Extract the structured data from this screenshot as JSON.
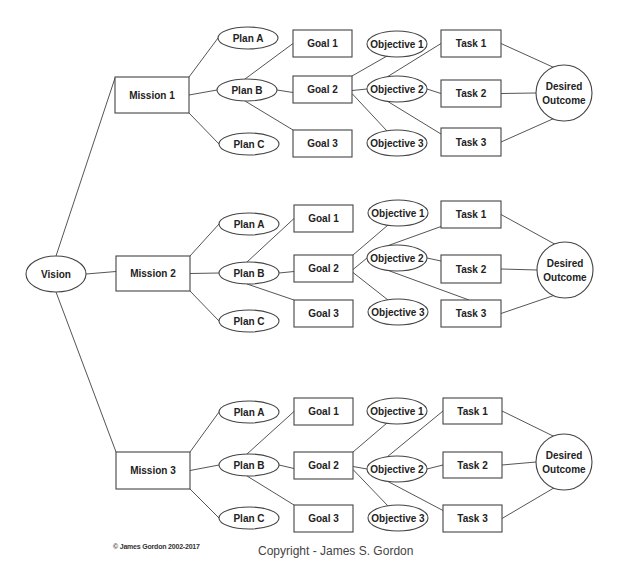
{
  "diagram": {
    "root": {
      "id": "vision",
      "label": "Vision",
      "shape": "ellipse",
      "cx": 56,
      "cy": 274,
      "rx": 30,
      "ry": 18
    },
    "missions": [
      {
        "id": "mission1",
        "label": "Mission 1",
        "box": {
          "x": 115,
          "y": 77,
          "w": 74,
          "h": 36
        },
        "plans": [
          {
            "label": "Plan A",
            "cx": 248,
            "cy": 38
          },
          {
            "label": "Plan B",
            "cx": 247,
            "cy": 90
          },
          {
            "label": "Plan C",
            "cx": 249,
            "cy": 144
          }
        ],
        "goals": [
          {
            "label": "Goal 1",
            "x": 293,
            "y": 30,
            "w": 59,
            "h": 27
          },
          {
            "label": "Goal 2",
            "x": 293,
            "y": 76,
            "w": 59,
            "h": 27
          },
          {
            "label": "Goal 3",
            "x": 293,
            "y": 130,
            "w": 59,
            "h": 27
          }
        ],
        "objectives": [
          {
            "label": "Objective 1",
            "cx": 397,
            "cy": 44
          },
          {
            "label": "Objective 2",
            "cx": 397,
            "cy": 89
          },
          {
            "label": "Objective 3",
            "cx": 397,
            "cy": 143
          }
        ],
        "tasks": [
          {
            "label": "Task 1",
            "x": 441,
            "y": 30,
            "w": 60,
            "h": 27
          },
          {
            "label": "Task 2",
            "x": 441,
            "y": 80,
            "w": 60,
            "h": 27
          },
          {
            "label": "Task 3",
            "x": 441,
            "y": 128,
            "w": 60,
            "h": 28
          }
        ],
        "outcome": {
          "line1": "Desired",
          "line2": "Outcome",
          "cx": 564,
          "cy": 93,
          "r": 28
        },
        "obj_task_links": [
          [
            2,
            1
          ],
          [
            2,
            2
          ],
          [
            2,
            3
          ]
        ]
      },
      {
        "id": "mission2",
        "label": "Mission 2",
        "box": {
          "x": 116,
          "y": 256,
          "w": 74,
          "h": 35
        },
        "plans": [
          {
            "label": "Plan A",
            "cx": 249,
            "cy": 224
          },
          {
            "label": "Plan B",
            "cx": 249,
            "cy": 273
          },
          {
            "label": "Plan C",
            "cx": 249,
            "cy": 321
          }
        ],
        "goals": [
          {
            "label": "Goal 1",
            "x": 294,
            "y": 205,
            "w": 59,
            "h": 27
          },
          {
            "label": "Goal 2",
            "x": 294,
            "y": 255,
            "w": 59,
            "h": 27
          },
          {
            "label": "Goal 3",
            "x": 294,
            "y": 300,
            "w": 59,
            "h": 27
          }
        ],
        "objectives": [
          {
            "label": "Objective 1",
            "cx": 398,
            "cy": 213
          },
          {
            "label": "Objective 2",
            "cx": 397,
            "cy": 258
          },
          {
            "label": "Objective 3",
            "cx": 398,
            "cy": 312
          }
        ],
        "tasks": [
          {
            "label": "Task 1",
            "x": 441,
            "y": 201,
            "w": 60,
            "h": 27
          },
          {
            "label": "Task 2",
            "x": 441,
            "y": 255,
            "w": 60,
            "h": 28
          },
          {
            "label": "Task 3",
            "x": 441,
            "y": 300,
            "w": 60,
            "h": 27
          }
        ],
        "outcome": {
          "line1": "Desired",
          "line2": "Outcome",
          "cx": 565,
          "cy": 270,
          "r": 28
        },
        "obj_task_links": [
          [
            2,
            1
          ],
          [
            2,
            2
          ],
          [
            2,
            3
          ]
        ]
      },
      {
        "id": "mission3",
        "label": "Mission 3",
        "box": {
          "x": 116,
          "y": 452,
          "w": 74,
          "h": 37
        },
        "plans": [
          {
            "label": "Plan A",
            "cx": 249,
            "cy": 412
          },
          {
            "label": "Plan B",
            "cx": 249,
            "cy": 465
          },
          {
            "label": "Plan C",
            "cx": 249,
            "cy": 518
          }
        ],
        "goals": [
          {
            "label": "Goal 1",
            "x": 294,
            "y": 398,
            "w": 59,
            "h": 27
          },
          {
            "label": "Goal 2",
            "x": 294,
            "y": 452,
            "w": 59,
            "h": 27
          },
          {
            "label": "Goal 3",
            "x": 294,
            "y": 505,
            "w": 59,
            "h": 27
          }
        ],
        "objectives": [
          {
            "label": "Objective 1",
            "cx": 397,
            "cy": 411
          },
          {
            "label": "Objective 2",
            "cx": 397,
            "cy": 469
          },
          {
            "label": "Objective 3",
            "cx": 398,
            "cy": 518
          }
        ],
        "tasks": [
          {
            "label": "Task 1",
            "x": 443,
            "y": 398,
            "w": 59,
            "h": 26
          },
          {
            "label": "Task 2",
            "x": 443,
            "y": 452,
            "w": 59,
            "h": 26
          },
          {
            "label": "Task 3",
            "x": 443,
            "y": 505,
            "w": 59,
            "h": 27
          }
        ],
        "outcome": {
          "line1": "Desired",
          "line2": "Outcome",
          "cx": 564,
          "cy": 462,
          "r": 28
        },
        "obj_task_links": [
          [
            2,
            1
          ],
          [
            2,
            2
          ],
          [
            2,
            3
          ]
        ]
      }
    ],
    "plan_ellipse": {
      "rx": 30,
      "ry": 11
    },
    "objective_ellipse": {
      "rx": 30,
      "ry": 13
    }
  },
  "footer": {
    "left": "© James Gordon 2002-2017",
    "right": "Copyright - James S. Gordon"
  }
}
